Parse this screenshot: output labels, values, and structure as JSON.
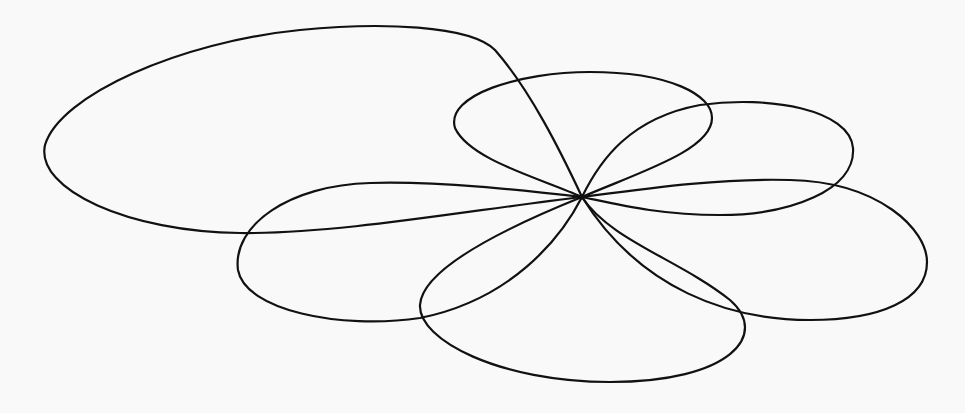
{
  "figure": {
    "title": "",
    "background": "#f9f9f9",
    "stroke_color": "#111111",
    "center": [
      582,
      197
    ],
    "lobes": [
      {
        "name": "large-upper-left-lobe",
        "path": "M582,197 C560,150 530,90 495,50 C470,25 380,22 300,30 C180,42 60,95 45,145 C35,190 130,232 240,233 C340,234 470,210 582,197 Z"
      },
      {
        "name": "upper-middle-lobe",
        "path": "M582,197 C540,178 470,160 455,128 C445,95 520,72 590,72 C670,72 712,95 712,118 C712,150 640,172 582,197 Z"
      },
      {
        "name": "upper-right-lobe",
        "path": "M582,197 C600,160 630,118 700,105 C770,95 850,110 853,148 C856,190 790,215 720,215 C660,215 620,205 582,197 Z"
      },
      {
        "name": "right-lobe",
        "path": "M582,197 C650,188 720,178 790,180 C880,182 927,230 927,262 C927,300 880,320 810,320 C730,320 640,290 582,197 Z"
      },
      {
        "name": "lower-middle-lobe",
        "path": "M582,197 C610,240 680,260 730,300 C770,335 730,382 610,382 C500,382 418,340 420,305 C422,270 500,230 582,197 Z"
      },
      {
        "name": "left-lower-lobe",
        "path": "M582,197 C560,240 510,300 420,318 C340,330 245,310 238,270 C232,225 290,185 370,183 C440,181 520,190 582,197 Z"
      }
    ]
  }
}
